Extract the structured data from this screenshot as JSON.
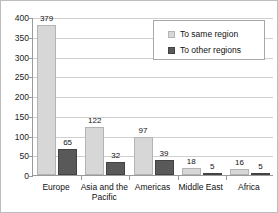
{
  "chart_data": {
    "type": "bar",
    "title": "",
    "xlabel": "",
    "ylabel": "",
    "ylim": [
      0,
      400
    ],
    "ytick_step": 50,
    "grid": true,
    "legend_position": "top-right",
    "categories": [
      "Europe",
      "Asia and the Pacific",
      "Americas",
      "Middle East",
      "Africa"
    ],
    "ytick_labels": [
      "400",
      "350",
      "300",
      "250",
      "200",
      "150",
      "100",
      "50",
      "0"
    ],
    "series": [
      {
        "name": "To same region",
        "color": "#d7d7d7",
        "values": [
          379,
          122,
          97,
          18,
          16
        ],
        "value_labels": [
          "379",
          "122",
          "97",
          "18",
          "16"
        ]
      },
      {
        "name": "To other regions",
        "color": "#595959",
        "values": [
          65,
          32,
          39,
          5,
          5
        ],
        "value_labels": [
          "65",
          "32",
          "39",
          "5",
          "5"
        ]
      }
    ]
  },
  "legend": {
    "items": [
      {
        "label": "To same region"
      },
      {
        "label": "To other regions"
      }
    ]
  }
}
